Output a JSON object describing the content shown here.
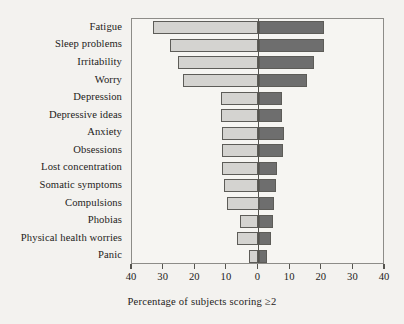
{
  "chart_data": {
    "type": "bar",
    "orientation": "horizontal-diverging",
    "title": "",
    "xlabel": "Percentage of subjects scoring ≥2",
    "ylabel": "",
    "xlim": [
      -40,
      40
    ],
    "grid": false,
    "legend": null,
    "axis_ticks": [
      {
        "value": -40,
        "label": "40"
      },
      {
        "value": -30,
        "label": "30"
      },
      {
        "value": -20,
        "label": "20"
      },
      {
        "value": -10,
        "label": "10"
      },
      {
        "value": 0,
        "label": "0"
      },
      {
        "value": 10,
        "label": "10"
      },
      {
        "value": 20,
        "label": "20"
      },
      {
        "value": 30,
        "label": "30"
      },
      {
        "value": 40,
        "label": "40"
      }
    ],
    "categories": [
      "Fatigue",
      "Sleep problems",
      "Irritability",
      "Worry",
      "Depression",
      "Depressive ideas",
      "Anxiety",
      "Obsessions",
      "Lost concentration",
      "Somatic symptoms",
      "Compulsions",
      "Phobias",
      "Physical health worries",
      "Panic"
    ],
    "series": [
      {
        "name": "left",
        "color": "#d4d3d0",
        "values": [
          33.5,
          28.0,
          25.5,
          24.0,
          12.0,
          12.0,
          11.5,
          11.5,
          11.5,
          11.0,
          10.0,
          6.0,
          6.8,
          3.0
        ]
      },
      {
        "name": "right",
        "color": "#6e6e6e",
        "values": [
          20.7,
          20.7,
          17.5,
          15.3,
          7.5,
          7.5,
          8.0,
          7.8,
          6.0,
          5.5,
          5.0,
          4.5,
          4.0,
          2.7
        ]
      }
    ]
  },
  "colors": {
    "page_background": "#f3f2ef",
    "plot_background": "#f6f5f2",
    "frame": "#8d8c88",
    "zero_line": "#55544f",
    "bar_outline": "#5d5c58",
    "bar_left": "#d4d3d0",
    "bar_right": "#6e6e6e",
    "text": "#1d1c1a"
  }
}
